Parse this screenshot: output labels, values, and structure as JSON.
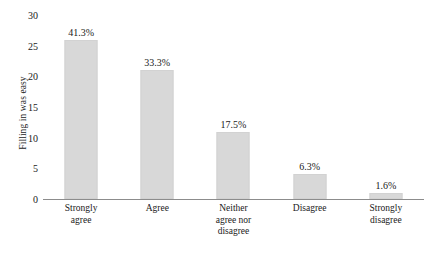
{
  "chart_data": {
    "type": "bar",
    "title": "",
    "xlabel": "",
    "ylabel": "Filling in was easy",
    "categories": [
      "Strongly agree",
      "Agree",
      "Neither agree nor disagree",
      "Disagree",
      "Strongly disagree"
    ],
    "category_lines": [
      [
        "Strongly",
        "agree"
      ],
      [
        "Agree"
      ],
      [
        "Neither",
        "agree nor",
        "disagree"
      ],
      [
        "Disagree"
      ],
      [
        "Strongly",
        "disagree"
      ]
    ],
    "values": [
      26,
      21,
      11,
      4,
      1
    ],
    "data_labels": [
      "41.3%",
      "33.3%",
      "17.5%",
      "6.3%",
      "1.6%"
    ],
    "percentages": [
      41.3,
      33.3,
      17.5,
      6.3,
      1.6
    ],
    "ylim": [
      0,
      30
    ],
    "yticks": [
      0,
      5,
      10,
      15,
      20,
      25,
      30
    ],
    "ytick_labels": [
      "0",
      "5",
      "10",
      "15",
      "20",
      "25",
      "30"
    ],
    "grid": false,
    "legend": false,
    "legend_position": "none",
    "bar_color": "#d8d8d8",
    "axis_color": "#8c8c8c",
    "text_color": "#1a1a1a"
  }
}
